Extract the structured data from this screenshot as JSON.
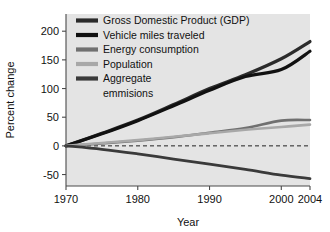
{
  "chart_data": {
    "type": "line",
    "title": "",
    "xlabel": "Year",
    "ylabel": "Percent change",
    "xlim": [
      1970,
      2004
    ],
    "ylim": [
      -70,
      230
    ],
    "xticks": [
      1970,
      1980,
      1990,
      2000,
      2004
    ],
    "xticklabels": [
      "1970",
      "1980",
      "1990",
      "2000",
      "2004"
    ],
    "yticks": [
      -50,
      0,
      50,
      100,
      150,
      200
    ],
    "yticklabels": [
      "-50",
      "0",
      "50",
      "100",
      "150",
      "200"
    ],
    "grid": false,
    "legend_position": "top-left",
    "zero_reference_line": 0,
    "plot_background": "#e4e4e4",
    "series": [
      {
        "name": "Gross Domestic Product (GDP)",
        "color": "#2b2b2b",
        "width": 3.2,
        "x": [
          1970,
          1975,
          1980,
          1985,
          1990,
          1995,
          2000,
          2004
        ],
        "values": [
          0,
          22,
          45,
          72,
          100,
          124,
          152,
          182
        ]
      },
      {
        "name": "Vehicle miles traveled",
        "color": "#111111",
        "width": 3.2,
        "x": [
          1970,
          1975,
          1980,
          1985,
          1990,
          1995,
          2000,
          2004
        ],
        "values": [
          0,
          21,
          44,
          70,
          97,
          121,
          133,
          165
        ]
      },
      {
        "name": "Energy consumption",
        "color": "#707070",
        "width": 2.6,
        "x": [
          1970,
          1975,
          1980,
          1985,
          1990,
          1995,
          2000,
          2004
        ],
        "values": [
          0,
          4,
          9,
          15,
          23,
          31,
          44,
          45
        ]
      },
      {
        "name": "Population",
        "color": "#a8a8a8",
        "width": 2.6,
        "x": [
          1970,
          1975,
          1980,
          1985,
          1990,
          1995,
          2000,
          2004
        ],
        "values": [
          0,
          5,
          10,
          16,
          22,
          28,
          33,
          37
        ]
      },
      {
        "name": "Aggregate emmisions",
        "color": "#3a3a3a",
        "width": 2.8,
        "x": [
          1970,
          1975,
          1980,
          1985,
          1990,
          1995,
          2000,
          2004
        ],
        "values": [
          0,
          -6,
          -14,
          -23,
          -32,
          -41,
          -51,
          -57
        ]
      }
    ]
  },
  "legend": {
    "items": [
      {
        "label": "Gross Domestic Product (GDP)",
        "color": "#2b2b2b"
      },
      {
        "label": "Vehicle miles traveled",
        "color": "#111111"
      },
      {
        "label": "Energy consumption",
        "color": "#707070"
      },
      {
        "label": "Population",
        "color": "#a8a8a8"
      },
      {
        "label": "Aggregate",
        "color": "#3a3a3a"
      },
      {
        "label": "emmisions",
        "color": ""
      }
    ]
  }
}
